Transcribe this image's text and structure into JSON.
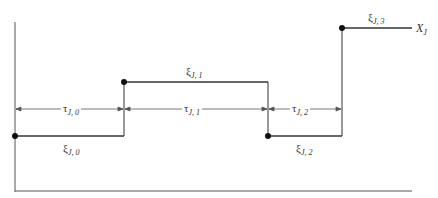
{
  "diagram": {
    "type": "step-function",
    "process_label": "X_J",
    "levels": [
      {
        "symbol": "ξ",
        "subscript": "J, 0",
        "x_start": 15,
        "x_end": 124,
        "y": 136
      },
      {
        "symbol": "ξ",
        "subscript": "J, 1",
        "x_start": 124,
        "x_end": 268,
        "y": 82
      },
      {
        "symbol": "ξ",
        "subscript": "J, 2",
        "x_start": 268,
        "x_end": 342,
        "y": 136
      },
      {
        "symbol": "ξ",
        "subscript": "J, 3",
        "x_start": 342,
        "x_end": 412,
        "y": 28
      }
    ],
    "intervals": [
      {
        "symbol": "τ",
        "subscript": "J, 0",
        "x_start": 15,
        "x_end": 124
      },
      {
        "symbol": "τ",
        "subscript": "J, 1",
        "x_start": 124,
        "x_end": 268
      },
      {
        "symbol": "τ",
        "subscript": "J, 2",
        "x_start": 268,
        "x_end": 342
      }
    ],
    "labels": {
      "xi0": {
        "sym": "ξ",
        "sub": "J, 0"
      },
      "xi1": {
        "sym": "ξ",
        "sub": "J, 1"
      },
      "xi2": {
        "sym": "ξ",
        "sub": "J, 2"
      },
      "xi3": {
        "sym": "ξ",
        "sub": "J, 3"
      },
      "tau0": {
        "sym": "τ",
        "sub": "J, 0"
      },
      "tau1": {
        "sym": "τ",
        "sub": "J, 1"
      },
      "tau2": {
        "sym": "τ",
        "sub": "J, 2"
      },
      "xj": {
        "sym": "X",
        "sub": "J"
      }
    },
    "colors": {
      "line": "#333333",
      "dim_line": "#555555",
      "dot": "#111111"
    }
  }
}
